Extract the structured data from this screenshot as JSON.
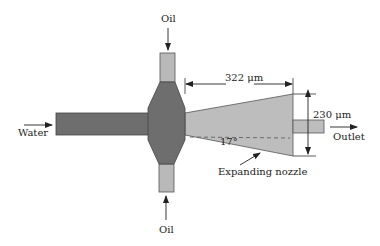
{
  "diagram": {
    "labels": {
      "oil_top": "Oil",
      "oil_bottom": "Oil",
      "water": "Water",
      "outlet": "Outlet",
      "nozzle": "Expanding nozzle",
      "length": "322 μm",
      "width": "230 μm",
      "angle": "17°"
    },
    "colors": {
      "dark_channel": "#6e6e6e",
      "light_channel": "#b9b9b9",
      "outline": "#444444",
      "text": "#222222"
    }
  }
}
